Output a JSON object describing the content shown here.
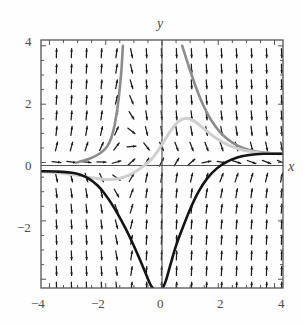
{
  "figure": {
    "kind": "slope-field-with-solution-curves",
    "background": "#fefefe"
  },
  "chart_data": {
    "type": "line",
    "title": "",
    "xlabel": "x",
    "ylabel": "y",
    "xlim": [
      -4.3,
      4.3
    ],
    "ylim": [
      -4.3,
      4.2
    ],
    "grid": false,
    "legend": null,
    "axes_style": "box-frame-with-interior-zero-axes",
    "xticks": [
      -4,
      -2,
      0,
      2,
      4
    ],
    "xticklabels": [
      "-4",
      "-2",
      "0",
      "2",
      "4"
    ],
    "yticks": [
      -2,
      0,
      2,
      4
    ],
    "yticklabels": [
      "-2",
      "0",
      "2",
      "4"
    ],
    "minor_tick_count_per_interval": 4,
    "slope_field": {
      "description": "grid of short direction arrows",
      "nx": 16,
      "ny": 16,
      "x_start": -4.0,
      "x_step": 0.5333,
      "y_start": 4.0,
      "y_step": -0.5333,
      "arrow_color": "#1c1c1c",
      "arrow_length_px": 9
    },
    "series": [
      {
        "name": "gray-solution-curve",
        "color": "#8c8c8c",
        "width": 2.6,
        "points_left_branch": [
          [
            -3.05,
            0.0
          ],
          [
            -2.6,
            0.12
          ],
          [
            -2.2,
            0.32
          ],
          [
            -1.95,
            0.55
          ],
          [
            -1.8,
            0.85
          ],
          [
            -1.68,
            1.3
          ],
          [
            -1.58,
            1.9
          ],
          [
            -1.5,
            2.55
          ],
          [
            -1.44,
            3.2
          ],
          [
            -1.39,
            4.0
          ]
        ],
        "points_right_branch": [
          [
            0.72,
            4.0
          ],
          [
            0.95,
            3.3
          ],
          [
            1.2,
            2.6
          ],
          [
            1.45,
            2.0
          ],
          [
            1.75,
            1.45
          ],
          [
            2.1,
            1.0
          ],
          [
            2.5,
            0.68
          ],
          [
            2.95,
            0.47
          ],
          [
            3.4,
            0.37
          ],
          [
            3.9,
            0.32
          ],
          [
            4.3,
            0.3
          ]
        ]
      },
      {
        "name": "light-gray-solution-curve",
        "color": "#cfcfcf",
        "width": 3.0,
        "points": [
          [
            -4.3,
            -0.32
          ],
          [
            -3.6,
            -0.36
          ],
          [
            -3.0,
            -0.44
          ],
          [
            -2.5,
            -0.52
          ],
          [
            -2.1,
            -0.57
          ],
          [
            -1.7,
            -0.57
          ],
          [
            -1.35,
            -0.5
          ],
          [
            -1.0,
            -0.34
          ],
          [
            -0.6,
            -0.08
          ],
          [
            -0.3,
            0.2
          ],
          [
            0.0,
            0.62
          ],
          [
            0.3,
            1.08
          ],
          [
            0.6,
            1.42
          ],
          [
            0.85,
            1.52
          ],
          [
            1.15,
            1.42
          ],
          [
            1.5,
            1.15
          ],
          [
            1.9,
            0.85
          ],
          [
            2.4,
            0.58
          ],
          [
            2.9,
            0.42
          ],
          [
            3.5,
            0.33
          ],
          [
            4.3,
            0.3
          ]
        ]
      },
      {
        "name": "black-solution-curve",
        "color": "#141414",
        "width": 2.6,
        "points": [
          [
            -4.3,
            -0.3
          ],
          [
            -3.7,
            -0.31
          ],
          [
            -3.2,
            -0.35
          ],
          [
            -2.9,
            -0.42
          ],
          [
            -2.6,
            -0.55
          ],
          [
            -2.3,
            -0.78
          ],
          [
            -2.05,
            -1.05
          ],
          [
            -1.8,
            -1.4
          ],
          [
            -1.55,
            -1.8
          ],
          [
            -1.3,
            -2.25
          ],
          [
            -1.05,
            -2.75
          ],
          [
            -0.82,
            -3.25
          ],
          [
            -0.6,
            -3.75
          ],
          [
            -0.4,
            -4.2
          ],
          [
            -0.2,
            -4.4
          ],
          [
            -0.05,
            -4.4
          ],
          [
            0.12,
            -4.1
          ],
          [
            0.3,
            -3.5
          ],
          [
            0.5,
            -2.85
          ],
          [
            0.75,
            -2.2
          ],
          [
            1.0,
            -1.6
          ],
          [
            1.3,
            -1.0
          ],
          [
            1.6,
            -0.55
          ],
          [
            1.95,
            -0.2
          ],
          [
            2.3,
            0.02
          ],
          [
            2.7,
            0.18
          ],
          [
            3.1,
            0.26
          ],
          [
            3.6,
            0.3
          ],
          [
            4.3,
            0.3
          ]
        ]
      }
    ]
  },
  "labels": {
    "x_axis_name": "x",
    "y_axis_name": "y",
    "x_tick_m4": "−4",
    "x_tick_m2": "−2",
    "x_tick_0": "0",
    "x_tick_2": "2",
    "x_tick_4": "4",
    "y_tick_4": "4",
    "y_tick_2": "2",
    "y_tick_0": "0",
    "y_tick_m2": "−2"
  },
  "colors": {
    "frame": "#555555",
    "axis": "#555555",
    "text": "#4a4a4a",
    "curve_gray": "#8c8c8c",
    "curve_light_gray": "#cfcfcf",
    "curve_black": "#141414",
    "slope_arrow": "#1c1c1c"
  }
}
